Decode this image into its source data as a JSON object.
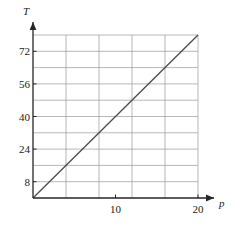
{
  "chart_data": {
    "type": "line",
    "title": "",
    "xlabel": "p",
    "ylabel": "T",
    "xlim": [
      0,
      22.5
    ],
    "ylim": [
      0,
      88
    ],
    "grid": true,
    "legend": null,
    "x_ticks": [
      {
        "value": 10,
        "label": "10"
      },
      {
        "value": 20,
        "label": "20"
      }
    ],
    "y_ticks": [
      {
        "value": 8,
        "label": "8"
      },
      {
        "value": 24,
        "label": "24"
      },
      {
        "value": 40,
        "label": "40"
      },
      {
        "value": 56,
        "label": "56"
      },
      {
        "value": 72,
        "label": "72"
      }
    ],
    "x_gridlines": [
      0,
      4,
      8,
      12,
      16,
      20
    ],
    "y_gridlines": [
      8,
      16,
      24,
      32,
      40,
      48,
      56,
      64,
      72,
      80
    ],
    "series": [
      {
        "name": "T vs p",
        "points": [
          {
            "x": 0,
            "y": 0
          },
          {
            "x": 20,
            "y": 80
          }
        ],
        "slope": 4,
        "intercept": 0,
        "color": "#4a4a4a"
      }
    ],
    "colors": {
      "axis": "#262626",
      "grid": "#9a9a9a",
      "line": "#4a4a4a",
      "text": "#1a1a1a",
      "background": "#ffffff"
    },
    "axis_arrows": {
      "x": "right-arrow",
      "y": "up-arrow"
    }
  }
}
